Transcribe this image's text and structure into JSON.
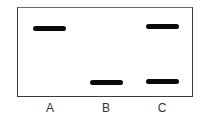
{
  "diagram": {
    "type": "gel-electrophoresis",
    "lanes": [
      {
        "label": "A",
        "center_x": 50,
        "bands": [
          {
            "x": 33,
            "y": 26,
            "width": 33
          }
        ]
      },
      {
        "label": "B",
        "center_x": 106,
        "bands": [
          {
            "x": 90,
            "y": 80,
            "width": 33
          }
        ]
      },
      {
        "label": "C",
        "center_x": 162,
        "bands": [
          {
            "x": 146,
            "y": 24,
            "width": 33
          },
          {
            "x": 146,
            "y": 79,
            "width": 33
          }
        ]
      }
    ],
    "colors": {
      "band": "#0a0a0a",
      "border": "#3a3a3a",
      "label": "#333333",
      "background": "#ffffff"
    }
  }
}
